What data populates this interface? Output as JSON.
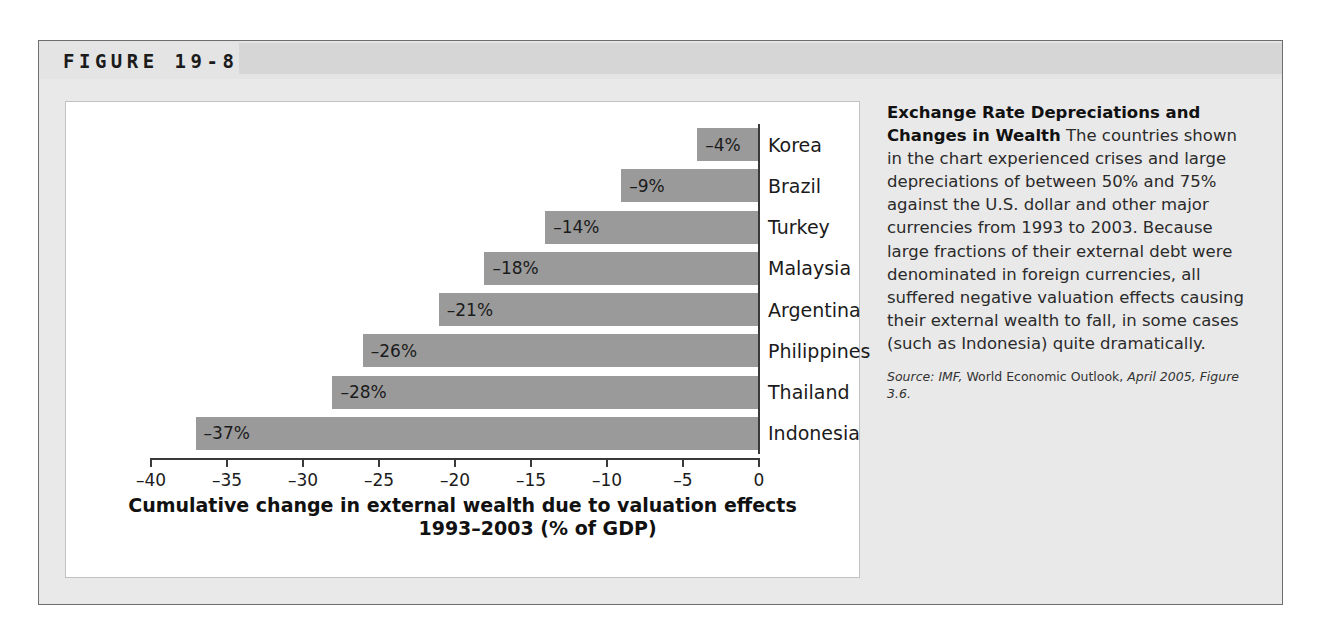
{
  "figure": {
    "title": "FIGURE 19-8"
  },
  "chart_data": {
    "type": "bar",
    "orientation": "horizontal",
    "title": "",
    "xlabel_line1": "Cumulative change in external wealth due to valuation effects",
    "xlabel_line2": "1993–2003 (% of GDP)",
    "ylabel": "",
    "xlim": [
      -40,
      0
    ],
    "grid": false,
    "legend": "none",
    "tick_labels": [
      "–40",
      "–35",
      "–30",
      "–25",
      "–20",
      "–15",
      "–10",
      "–5",
      "0"
    ],
    "ticks": [
      -40,
      -35,
      -30,
      -25,
      -20,
      -15,
      -10,
      -5,
      0
    ],
    "categories": [
      "Korea",
      "Brazil",
      "Turkey",
      "Malaysia",
      "Argentina",
      "Philippines",
      "Thailand",
      "Indonesia"
    ],
    "values": [
      -4,
      -9,
      -14,
      -18,
      -21,
      -26,
      -28,
      -37
    ],
    "data_labels": [
      "–4%",
      "–9%",
      "–14%",
      "–18%",
      "–21%",
      "–26%",
      "–28%",
      "–37%"
    ],
    "bar_color": "#9a9a9a",
    "axis_color": "#3a3a3a"
  },
  "caption": {
    "lede": "Exchange Rate Depreciations and Changes in Wealth",
    "body": " The countries shown in the chart experienced crises and large depreciations of between 50% and 75% against the U.S. dollar and other major currencies from 1993 to 2003. Because large fractions of their external debt were denominated in foreign currencies, all suffered negative valuation effects causing their external wealth to fall, in some cases (such as Indonesia) quite dramatically.",
    "source_prefix": "Source: IMF,",
    "source_work": " World Economic Outlook,",
    "source_date": " April 2005,",
    "source_figure": "Figure 3.6."
  }
}
